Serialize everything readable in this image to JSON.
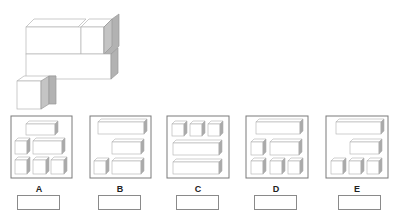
{
  "question": {
    "figure": "stacked-box-structure",
    "colors": {
      "edge": "#b0b0b0",
      "face": "#ffffff",
      "side_shade": "#a8a8a8",
      "panel_border": "#7a7a7a"
    }
  },
  "options": [
    {
      "label": "A",
      "answer": ""
    },
    {
      "label": "B",
      "answer": ""
    },
    {
      "label": "C",
      "answer": ""
    },
    {
      "label": "D",
      "answer": ""
    },
    {
      "label": "E",
      "answer": ""
    }
  ]
}
